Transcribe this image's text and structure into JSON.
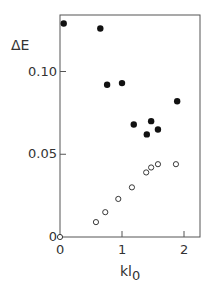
{
  "chart_data": {
    "type": "scatter",
    "title": "",
    "xlabel": "kl0",
    "xlabel_main": "kl",
    "xlabel_sub": "0",
    "ylabel": "ΔE",
    "xlim": [
      0,
      2.25
    ],
    "ylim": [
      0,
      0.135
    ],
    "xticks": [
      0,
      1,
      2
    ],
    "xtick_labels": [
      "0",
      "1",
      "2"
    ],
    "yticks": [
      0,
      0.05,
      0.1
    ],
    "ytick_labels": [
      "0",
      "0.05",
      "0.10"
    ],
    "grid": false,
    "legend": null,
    "series": [
      {
        "name": "filled",
        "marker": "filled-circle",
        "x": [
          0.06,
          0.65,
          0.76,
          1.0,
          1.19,
          1.4,
          1.47,
          1.58,
          1.89
        ],
        "y": [
          0.129,
          0.126,
          0.092,
          0.093,
          0.068,
          0.062,
          0.07,
          0.065,
          0.082
        ]
      },
      {
        "name": "open",
        "marker": "open-circle",
        "x": [
          0.0,
          0.58,
          0.73,
          0.94,
          1.16,
          1.39,
          1.47,
          1.58,
          1.87
        ],
        "y": [
          0.0,
          0.009,
          0.015,
          0.023,
          0.03,
          0.039,
          0.042,
          0.044,
          0.044
        ]
      }
    ]
  },
  "colors": {
    "axis": "#555555",
    "marker": "#111111",
    "text": "#333333"
  }
}
